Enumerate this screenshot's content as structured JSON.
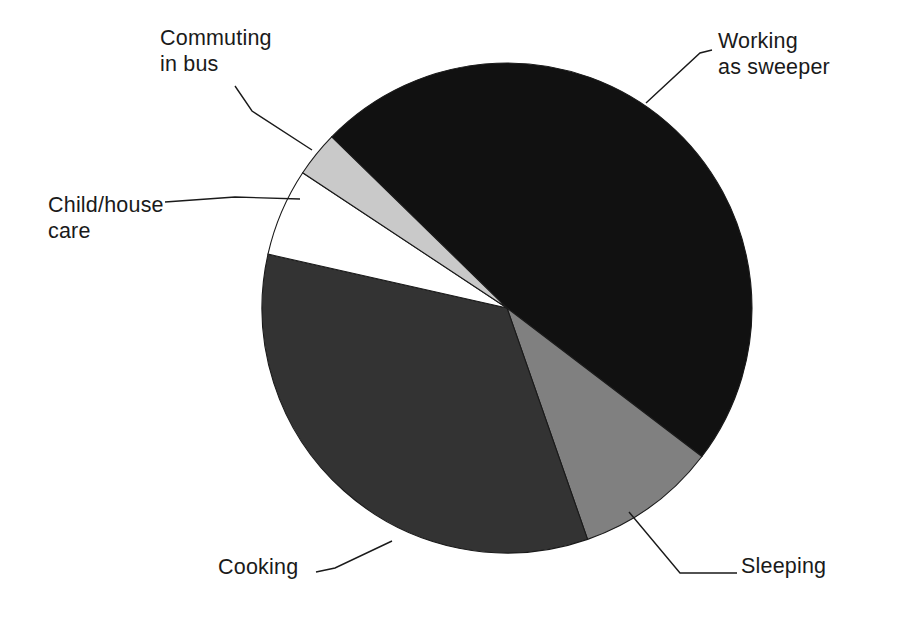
{
  "chart_data": {
    "type": "pie",
    "title": "",
    "subtitle": "",
    "xlabel": "",
    "ylabel": "",
    "legend_position": "none",
    "grid": false,
    "labels_position": "outside-with-leader-lines",
    "start_angle_deg": 135.7,
    "direction": "clockwise",
    "categories": [
      "Working as sweeper",
      "Sleeping",
      "Cooking",
      "Child/house care",
      "Commuting in bus"
    ],
    "values": [
      48.0,
      9.3,
      33.9,
      5.8,
      3.0
    ],
    "units": "percent",
    "slices": [
      {
        "label": "Working as sweeper",
        "value": 48.0,
        "color": "#111111",
        "start_angle_deg": 135.7,
        "end_angle_deg": -37.3,
        "sweep_deg": 173.0
      },
      {
        "label": "Sleeping",
        "value": 9.3,
        "color": "#808080",
        "start_angle_deg": -37.3,
        "end_angle_deg": -70.8,
        "sweep_deg": 33.5
      },
      {
        "label": "Cooking",
        "value": 33.9,
        "color": "#333333",
        "start_angle_deg": -70.8,
        "end_angle_deg": -192.7,
        "sweep_deg": 121.9
      },
      {
        "label": "Child/house care",
        "value": 5.8,
        "color": "#ffffff",
        "start_angle_deg": 167.3,
        "end_angle_deg": 146.5,
        "sweep_deg": 20.8
      },
      {
        "label": "Commuting in bus",
        "value": 3.0,
        "color": "#c9c9c9",
        "start_angle_deg": 146.5,
        "end_angle_deg": 135.7,
        "sweep_deg": 10.8
      }
    ]
  },
  "labels": {
    "working": "Working\nas sweeper",
    "commuting": "Commuting\nin bus",
    "child": "Child/house\ncare",
    "cooking": "Cooking",
    "sleeping": "Sleeping"
  },
  "colors": {
    "working_as_sweeper": "#111111",
    "sleeping": "#808080",
    "cooking": "#333333",
    "child_house_care": "#ffffff",
    "commuting_in_bus": "#c9c9c9",
    "outline": "#1a1a1a",
    "background": "#ffffff",
    "text": "#1a1a1a"
  }
}
